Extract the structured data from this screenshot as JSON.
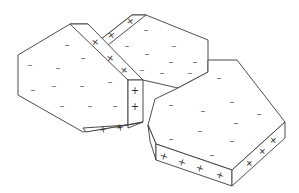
{
  "diagram": {
    "colors": {
      "stroke": "#3a3a3a",
      "fill": "#ffffff",
      "symbol": "#333333"
    },
    "symbols": {
      "negative": "–",
      "positive": "+"
    },
    "plates": [
      {
        "name": "plate-left",
        "face_label": "negative face",
        "edge_label": "positive edge",
        "negative_count": 13,
        "positive_count": 6
      },
      {
        "name": "plate-middle",
        "face_label": "negative face",
        "edge_label": "positive edge",
        "negative_count": 13,
        "positive_count": 2
      },
      {
        "name": "plate-right",
        "face_label": "negative face",
        "edge_label": "positive edge",
        "negative_count": 11,
        "positive_count": 7
      }
    ]
  }
}
